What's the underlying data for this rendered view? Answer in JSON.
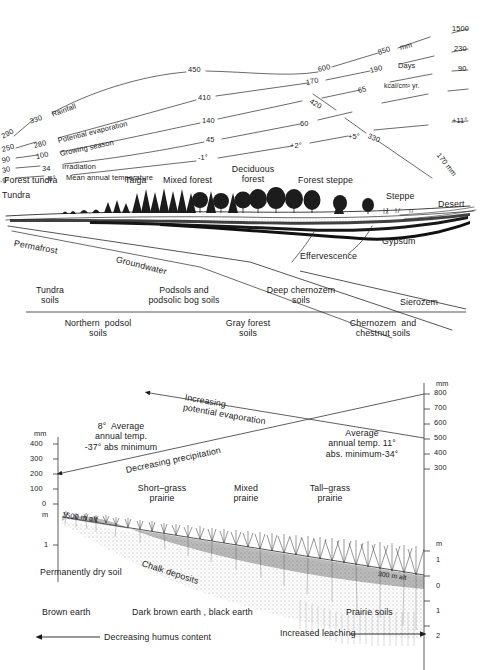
{
  "figure": {
    "type": "scientific-transect-diagram",
    "panels": [
      "eurasian-transect",
      "north-american-prairie-transect"
    ]
  },
  "panel_top": {
    "title_hidden": "",
    "left_axis_values": [
      "290",
      "250",
      "90",
      "30",
      "-9°"
    ],
    "left_series_labels": [
      {
        "value": "330",
        "name": "Rainfall"
      },
      {
        "value": "280",
        "name": "Potential evaporation"
      },
      {
        "value": "100",
        "name": "Growing season"
      },
      {
        "value": "34",
        "name": "Irradiation"
      },
      {
        "value": "-6°",
        "name": "Mean annual temperature"
      }
    ],
    "mid_values_a": [
      "450",
      "410",
      "140",
      "45",
      "-1°"
    ],
    "mid_values_b": [
      "600",
      "170",
      "420",
      "60",
      "+2°"
    ],
    "mid_values_c": [
      "850",
      "190",
      "65",
      "+5°",
      "330"
    ],
    "unit_labels": [
      "mm",
      "Days",
      "kcal/cm² yr."
    ],
    "right_values": [
      "1500",
      "230",
      "90",
      "+11°"
    ],
    "descending_label": "170 mm",
    "vegetation_zones": [
      "Tundra",
      "Forest tundra",
      "Taiga",
      "Mixed forest",
      "Deciduous\nforest",
      "Forest steppe",
      "Steppe",
      "Desert"
    ],
    "subsurface_labels": [
      "Permafrost",
      "Groundwater",
      "Effervescence",
      "Gypsum"
    ]
  },
  "soils": {
    "above_line": [
      "Tundra\nsoils",
      "Podsols and\npodsolic bog soils",
      "Deep chernozem\nsoils",
      "Sierozem"
    ],
    "below_line": [
      "Northern  podsol\nsoils",
      "Gray forest\nsoils",
      "Chernozem  and\nchestnut soils"
    ]
  },
  "panel_bottom": {
    "left_axis": {
      "unit": "mm",
      "ticks": [
        "400",
        "300",
        "200",
        "100",
        "0"
      ],
      "depth_unit": "m",
      "depth_ticks": [
        "1"
      ]
    },
    "right_axis": {
      "unit": "mm",
      "ticks": [
        "800",
        "700",
        "600",
        "500",
        "400",
        "300"
      ],
      "depth_unit": "m",
      "depth_ticks": [
        "1",
        "0",
        "1",
        "2"
      ]
    },
    "arrow_labels": [
      "Increasing\npotential evaporation",
      "Decreasing  precipitation",
      "Decreasing  humus content",
      "Increased  leaching"
    ],
    "climate_left": "8°  Average\nannual temp.\n-37° abs minimum",
    "climate_right": "Average\nannual temp. 11°\nabs. minimum-34°",
    "prairie_zones": [
      "Short–grass\nprairie",
      "Mixed\nprairie",
      "Tall–grass\nprairie"
    ],
    "altitude_left": "1500 m alt.",
    "altitude_right": "300 m alt",
    "soil_notes": [
      "Permanently dry soil",
      "Chalk deposits",
      "Brown  earth",
      "Dark  brown  earth , black  earth",
      "Prairie  soils"
    ]
  },
  "colors": {
    "ink": "#1a1a1a",
    "line": "#2a2a2a",
    "soil_dark": "#2b2b2b",
    "soil_mid": "#6f6f6f",
    "soil_light": "#bdbdbd",
    "paper": "#ffffff"
  }
}
